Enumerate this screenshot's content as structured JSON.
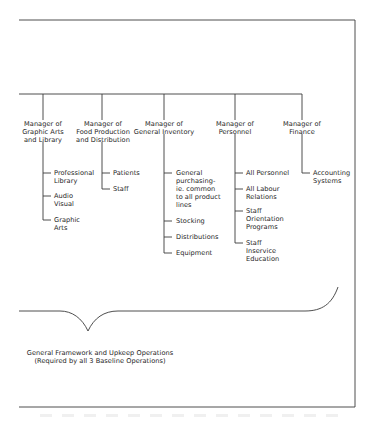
{
  "diagram": {
    "type": "org-chart",
    "managers": [
      {
        "label": "Manager of\nGraphic Arts\nand Library",
        "items": [
          "Professional\nLibrary",
          "Audio\nVisual",
          "Graphic\nArts"
        ]
      },
      {
        "label": "Manager of\nFood Production\nand Distribution",
        "items": [
          "Patients",
          "Staff"
        ]
      },
      {
        "label": "Manager of\nGeneral Inventory",
        "items": [
          "General\npurchasing-\nie. common\nto all product\nlines",
          "Stocking",
          "Distributions",
          "Equipment"
        ]
      },
      {
        "label": "Manager of\nPersonnel",
        "items": [
          "All Personnel",
          "All Labour\nRelations",
          "Staff\nOrientation\nPrograms",
          "Staff\nInservice\nEducation"
        ]
      },
      {
        "label": "Manager of\nFinance",
        "items": [
          "Accounting\nSystems"
        ]
      }
    ],
    "brace_caption": {
      "line1": "General Framework and Upkeep Operations",
      "line2": "(Required by all 3 Baseline Operations)"
    },
    "colors": {
      "line": "#3a3a3a",
      "text": "#1e1e1e",
      "background": "#ffffff"
    }
  }
}
